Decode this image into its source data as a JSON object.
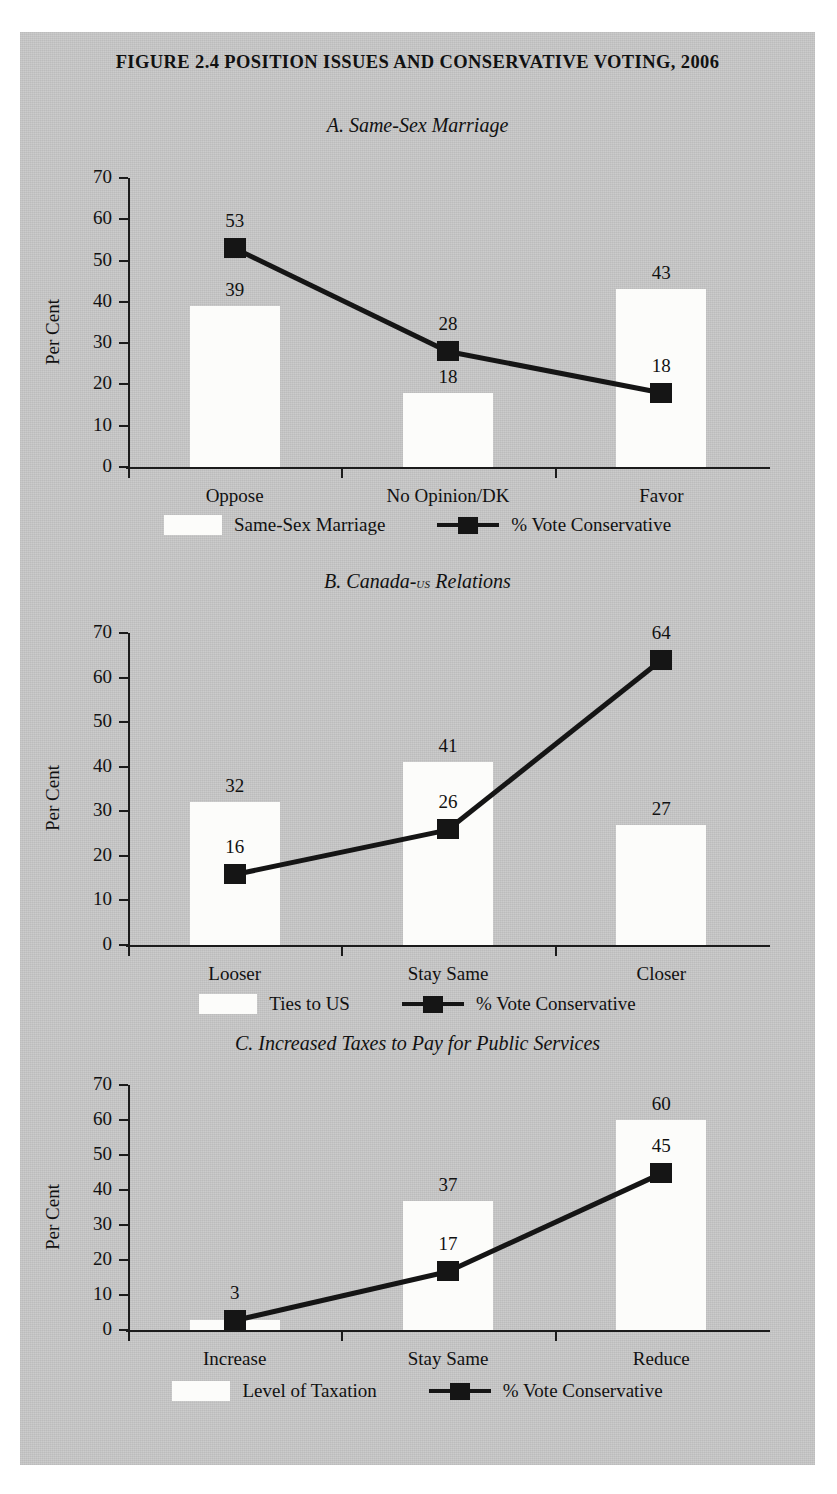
{
  "figure": {
    "title": "FIGURE 2.4 POSITION ISSUES AND CONSERVATIVE VOTING, 2006"
  },
  "common": {
    "ylabel": "Per Cent",
    "yticks": [
      "70",
      "60",
      "50",
      "40",
      "30",
      "20",
      "10",
      "0"
    ],
    "line_legend_label": "% Vote Conservative",
    "bar_color": "#fcfcfa",
    "line_color": "#151515",
    "panel_bg": "#c9c9c9"
  },
  "panels": [
    {
      "title": "A. Same-Sex Marriage",
      "title_plain": "A. Same-Sex Marriage",
      "bar_legend_label": "Same-Sex Marriage",
      "categories": [
        "Oppose",
        "No Opinion/DK",
        "Favor"
      ],
      "bar_values": [
        39,
        18,
        43
      ],
      "line_values": [
        53,
        28,
        18
      ],
      "bar_labels": [
        "39",
        "18",
        "43"
      ],
      "line_labels": [
        "53",
        "28",
        "18"
      ]
    },
    {
      "title": "B. Canada-US Relations",
      "title_prefix": "B. Canada-",
      "title_smallcaps": "us",
      "title_suffix": " Relations",
      "bar_legend_label": "Ties to US",
      "categories": [
        "Looser",
        "Stay Same",
        "Closer"
      ],
      "bar_values": [
        32,
        41,
        27
      ],
      "line_values": [
        16,
        26,
        64
      ],
      "bar_labels": [
        "32",
        "41",
        "27"
      ],
      "line_labels": [
        "16",
        "26",
        "64"
      ]
    },
    {
      "title": "C. Increased Taxes to Pay for Public Services",
      "title_plain": "C. Increased Taxes to Pay for Public Services",
      "bar_legend_label": "Level of Taxation",
      "categories": [
        "Increase",
        "Stay Same",
        "Reduce"
      ],
      "bar_values": [
        3,
        37,
        60
      ],
      "line_values": [
        3,
        17,
        45
      ],
      "bar_labels": [
        "",
        "37",
        "60"
      ],
      "line_labels": [
        "3",
        "17",
        "45"
      ]
    }
  ],
  "chart_data": {
    "type": "bar",
    "title": "FIGURE 2.4 POSITION ISSUES AND CONSERVATIVE VOTING, 2006",
    "ylabel": "Per Cent",
    "xlabel": "",
    "ylim": [
      0,
      70
    ],
    "yticks": [
      0,
      10,
      20,
      30,
      40,
      50,
      60,
      70
    ],
    "grid": false,
    "legend_position": "bottom",
    "panels": [
      {
        "panel": "A",
        "subtitle": "A. Same-Sex Marriage",
        "categories": [
          "Oppose",
          "No Opinion/DK",
          "Favor"
        ],
        "series": [
          {
            "name": "Same-Sex Marriage",
            "type": "bar",
            "values": [
              39,
              18,
              43
            ]
          },
          {
            "name": "% Vote Conservative",
            "type": "line",
            "values": [
              53,
              28,
              18
            ]
          }
        ]
      },
      {
        "panel": "B",
        "subtitle": "B. Canada-US Relations",
        "categories": [
          "Looser",
          "Stay Same",
          "Closer"
        ],
        "series": [
          {
            "name": "Ties to US",
            "type": "bar",
            "values": [
              32,
              41,
              27
            ]
          },
          {
            "name": "% Vote Conservative",
            "type": "line",
            "values": [
              16,
              26,
              64
            ]
          }
        ]
      },
      {
        "panel": "C",
        "subtitle": "C. Increased Taxes to Pay for Public Services",
        "categories": [
          "Increase",
          "Stay Same",
          "Reduce"
        ],
        "series": [
          {
            "name": "Level of Taxation",
            "type": "bar",
            "values": [
              3,
              37,
              60
            ]
          },
          {
            "name": "% Vote Conservative",
            "type": "line",
            "values": [
              3,
              17,
              45
            ]
          }
        ]
      }
    ]
  }
}
